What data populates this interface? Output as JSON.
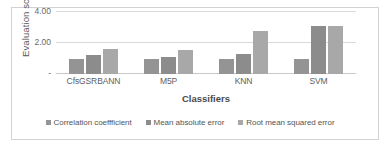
{
  "chart_data": {
    "type": "bar",
    "title": "",
    "xlabel": "Classifiers",
    "ylabel": "Evaluation score",
    "categories": [
      "CfsGSRBANN",
      "M5P",
      "KNN",
      "SVM"
    ],
    "series": [
      {
        "name": "Correlation coeffficient",
        "color": "#949494",
        "values": [
          0.98,
          0.98,
          0.95,
          0.95
        ]
      },
      {
        "name": "Mean absolute error",
        "color": "#8c8c8c",
        "values": [
          1.2,
          1.1,
          1.3,
          3.1
        ]
      },
      {
        "name": "Root mean squared error",
        "color": "#a8a8a8",
        "values": [
          1.62,
          1.55,
          2.75,
          3.1
        ]
      }
    ],
    "ylim": [
      0,
      4
    ],
    "yticks": [
      {
        "value": 0,
        "label": "-"
      },
      {
        "value": 2,
        "label": "2.00"
      },
      {
        "value": 4,
        "label": "4.00"
      }
    ],
    "grid": true,
    "legend_position": "bottom"
  },
  "legend": {
    "items": [
      {
        "label": "Correlation coeffficient"
      },
      {
        "label": "Mean absolute error"
      },
      {
        "label": "Root mean squared error"
      }
    ]
  }
}
